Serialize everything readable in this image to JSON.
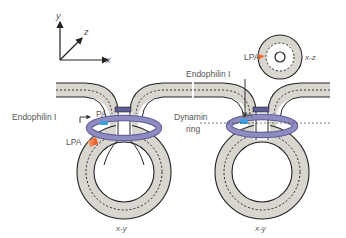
{
  "axes": {
    "x": "x",
    "y": "y",
    "z": "z"
  },
  "left_panel": {
    "labels": {
      "endophilin": "Endophilin I",
      "pa": "PA",
      "lpa": "LPA",
      "plane": "x-y"
    }
  },
  "right_panel": {
    "labels": {
      "endophilin": "Endophilin I",
      "pa": "PA",
      "lpa": "LPA",
      "dynamin": "Dynamin",
      "ring": "ring",
      "plane_top": "x-z",
      "plane_bottom": "x-y"
    }
  },
  "colors": {
    "membrane_fill": "#d9d6d0",
    "outline": "#222222",
    "dynamin_ring": "#8e8cc0",
    "dynamin_ring_dark": "#5f5d96",
    "pa_blue": "#3aa0e0",
    "lpa_orange": "#f06a2a",
    "label_gray": "#555555"
  }
}
